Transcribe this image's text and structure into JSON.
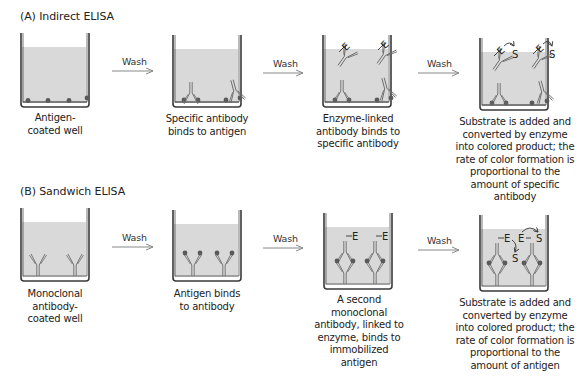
{
  "panels": [
    {
      "id": "A",
      "title": "(A)  Indirect ELISA",
      "wash_label": "Wash",
      "steps": [
        {
          "caption": "Antigen-\ncoated well"
        },
        {
          "caption": "Specific antibody binds to antigen"
        },
        {
          "caption": "Enzyme-linked antibody binds to specific antibody"
        },
        {
          "caption": "Substrate is added and converted by enzyme into colored product; the rate of color formation is proportional to the amount of specific antibody"
        }
      ]
    },
    {
      "id": "B",
      "title": "(B)  Sandwich ELISA",
      "wash_label": "Wash",
      "steps": [
        {
          "caption": "Monoclonal antibody-coated well"
        },
        {
          "caption": "Antigen binds to antibody"
        },
        {
          "caption": "A second monoclonal antibody, linked to enzyme, binds to immobilized antigen"
        },
        {
          "caption": "Substrate is added and converted by enzyme into colored product; the rate of color formation is proportional to the amount of antigen"
        }
      ]
    }
  ],
  "labels": {
    "enzyme": "E",
    "substrate": "S"
  },
  "colors": {
    "liquid": "#d9d9d9",
    "well_outline": "#3a3a3a",
    "antigen": "#5a5a5a",
    "antibody": "#6b6b6b",
    "arrow": "#888888"
  }
}
